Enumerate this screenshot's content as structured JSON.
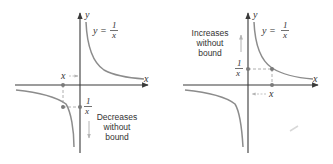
{
  "colors": {
    "axis": "#3a3a3a",
    "curve": "#8c8c8c",
    "guide": "#9a9a9a",
    "arrow": "#b4b4b4",
    "point": "#7a7a7a",
    "text": "#333333"
  },
  "panels": [
    {
      "id": "left",
      "function_label": {
        "lhs": "y =",
        "num": "1",
        "den": "x"
      },
      "y_axis_label": "y",
      "x_axis_label": "x",
      "x_point_label": "x",
      "recip_label": {
        "num": "1",
        "den": "x"
      },
      "annotation": [
        "Decreases",
        "without",
        "bound"
      ],
      "arrow_direction": "down"
    },
    {
      "id": "right",
      "function_label": {
        "lhs": "y =",
        "num": "1",
        "den": "x"
      },
      "y_axis_label": "y",
      "x_axis_label": "x",
      "x_point_label": "x",
      "recip_label": {
        "num": "1",
        "den": "x"
      },
      "annotation": [
        "Increases",
        "without",
        "bound"
      ],
      "arrow_direction": "up"
    }
  ]
}
